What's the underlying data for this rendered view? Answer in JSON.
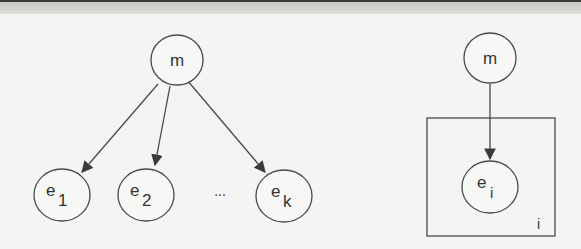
{
  "diagram": {
    "type": "graphical-model",
    "left_graph": {
      "parent": {
        "label": "m"
      },
      "children": [
        {
          "base": "e",
          "sub": "1"
        },
        {
          "base": "e",
          "sub": "2"
        },
        {
          "base": "e",
          "sub": "k"
        }
      ],
      "ellipsis": "..."
    },
    "right_graph": {
      "parent": {
        "label": "m"
      },
      "child": {
        "base": "e",
        "sub": "i"
      },
      "plate_label": "i"
    }
  }
}
